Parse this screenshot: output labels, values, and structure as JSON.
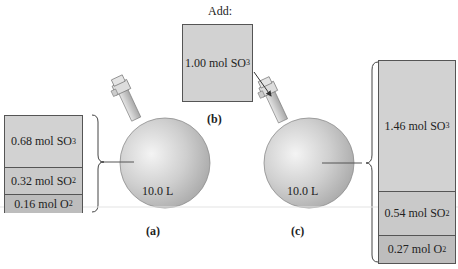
{
  "figure": {
    "panel_a": {
      "label": "(a)",
      "volume": "10.0 L",
      "contents": [
        {
          "amount": "0.68 mol SO",
          "sub": "3"
        },
        {
          "amount": "0.32 mol SO",
          "sub": "2"
        },
        {
          "amount": "0.16 mol O",
          "sub": "2"
        }
      ]
    },
    "panel_b": {
      "label": "(b)",
      "heading": "Add:",
      "contents": [
        {
          "amount": "1.00 mol SO",
          "sub": "3"
        }
      ]
    },
    "panel_c": {
      "label": "(c)",
      "volume": "10.0 L",
      "contents": [
        {
          "amount": "1.46 mol SO",
          "sub": "3"
        },
        {
          "amount": "0.54 mol SO",
          "sub": "2"
        },
        {
          "amount": "0.27 mol O",
          "sub": "2"
        }
      ]
    }
  }
}
